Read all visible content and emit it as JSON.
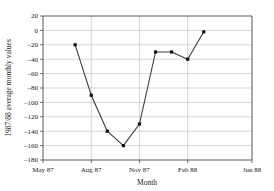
{
  "chart_data": {
    "type": "line",
    "title": "",
    "xlabel": "Month",
    "ylabel": "1987/88 average monthly values",
    "x": [
      "Jul 87",
      "Aug 87",
      "Sep 87",
      "Oct 87",
      "Nov 87",
      "Dec 87",
      "Jan 88",
      "Feb 88",
      "Mar 88"
    ],
    "values": [
      -20,
      -90,
      -140,
      -160,
      -130,
      -30,
      -30,
      -40,
      -2
    ],
    "x_numeric": [
      2,
      3,
      4,
      5,
      6,
      7,
      8,
      9,
      10
    ],
    "xlim": [
      0,
      13
    ],
    "ylim": [
      -180,
      20
    ],
    "xticks": [
      0,
      3,
      6,
      9,
      13
    ],
    "xticklabels": [
      "May 87",
      "Aug 87",
      "Nov 87",
      "Feb 88",
      "Jun 88"
    ],
    "yticks": [
      20,
      0,
      -20,
      -40,
      -60,
      -80,
      -100,
      -120,
      -140,
      -160,
      -180
    ],
    "yticklabels": [
      "20",
      "0",
      "–20",
      "–40",
      "–60",
      "–80",
      "–100",
      "–120",
      "–140",
      "–160",
      "–180"
    ],
    "grid": true,
    "grid_axes": "both",
    "legend": "none",
    "marker": "square",
    "line_color": "#3a3a3a",
    "marker_color": "#111111",
    "grid_color": "#b9b9b9",
    "axis_color": "#4d4d4d",
    "background": "#ffffff"
  },
  "axes": {
    "x_title": "Month",
    "y_title": "1987/88 average monthly values"
  }
}
